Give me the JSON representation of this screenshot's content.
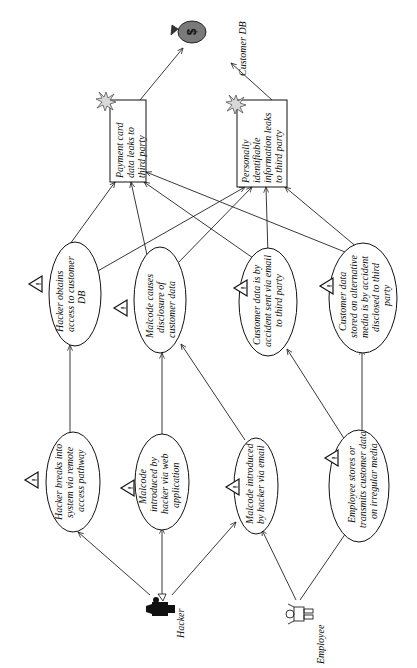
{
  "diagram": {
    "type": "attack-tree / misuse-case diagram",
    "orientation": "rotated 90 degrees counter-clockwise",
    "assets": {
      "money": {
        "icon": "money-bag-icon",
        "glyph": "$"
      },
      "customer_db": {
        "label": "Customer DB"
      }
    },
    "harms": [
      {
        "id": "payment",
        "lines": [
          "Payment card",
          "data leaks to",
          "third party"
        ],
        "icon": "explosion-icon"
      },
      {
        "id": "pii",
        "lines": [
          "Personally",
          "identifiable",
          "information leaks",
          "to third party"
        ],
        "icon": "explosion-icon"
      }
    ],
    "threats": [
      {
        "id": "t1",
        "lines": [
          "Hacker obtains",
          "access to customer",
          "DB"
        ]
      },
      {
        "id": "t2",
        "lines": [
          "Malcode causes",
          "disclosure of",
          "customer data"
        ]
      },
      {
        "id": "t3",
        "lines": [
          "Customer data is by",
          "accident sent via email",
          "to third party"
        ]
      },
      {
        "id": "t4",
        "lines": [
          "Customer data",
          "stored on alternative",
          "media is by accident",
          "disclosed to third",
          "party"
        ]
      }
    ],
    "causes": [
      {
        "id": "c1",
        "lines": [
          "Hacker breaks into",
          "system via remote",
          "access pathway"
        ]
      },
      {
        "id": "c2",
        "lines": [
          "Malcode",
          "introduced by",
          "hacker via web",
          "application"
        ]
      },
      {
        "id": "c3",
        "lines": [
          "Malcode introduced",
          "by hacker via email"
        ]
      },
      {
        "id": "c4",
        "lines": [
          "Employee stores or",
          "transmits customer data",
          "on irregular media"
        ]
      }
    ],
    "actors": [
      {
        "id": "hacker",
        "label": "Hacker",
        "icon": "hacker-icon"
      },
      {
        "id": "employee",
        "label": "Employee",
        "icon": "employee-icon"
      }
    ],
    "warning_icon": "!",
    "edges": [
      [
        "hacker",
        "c1"
      ],
      [
        "hacker",
        "c2"
      ],
      [
        "hacker",
        "c3"
      ],
      [
        "employee",
        "c3"
      ],
      [
        "employee",
        "c4"
      ],
      [
        "c1",
        "t1"
      ],
      [
        "c2",
        "t2"
      ],
      [
        "c3",
        "t2"
      ],
      [
        "c4",
        "t3"
      ],
      [
        "c4",
        "t4"
      ],
      [
        "t1",
        "payment"
      ],
      [
        "t1",
        "pii"
      ],
      [
        "t2",
        "payment"
      ],
      [
        "t2",
        "pii"
      ],
      [
        "t3",
        "payment"
      ],
      [
        "t3",
        "pii"
      ],
      [
        "t4",
        "payment"
      ],
      [
        "t4",
        "pii"
      ],
      [
        "payment",
        "money"
      ],
      [
        "pii",
        "customer_db"
      ]
    ]
  }
}
